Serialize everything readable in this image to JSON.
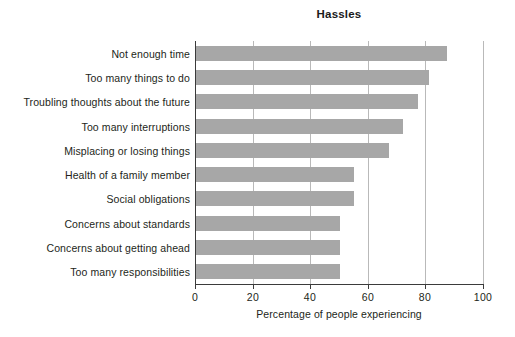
{
  "chart_data": {
    "type": "bar",
    "orientation": "horizontal",
    "title": "Hassles",
    "xlabel": "Percentage of people experiencing",
    "ylabel": "",
    "xlim": [
      0,
      100
    ],
    "xticks": [
      0,
      20,
      40,
      60,
      80,
      100
    ],
    "xtick_labels": [
      "0",
      "20",
      "40",
      "60",
      "80",
      "100"
    ],
    "grid": "vertical",
    "legend": "none",
    "bar_color": "#a7a7a7",
    "categories": [
      "Not enough time",
      "Too many things to do",
      "Troubling thoughts about the future",
      "Too many interruptions",
      "Misplacing or losing things",
      "Health of a family member",
      "Social obligations",
      "Concerns about standards",
      "Concerns about getting ahead",
      "Too many responsibilities"
    ],
    "values": [
      87,
      81,
      77,
      72,
      67,
      55,
      55,
      50,
      50,
      50
    ]
  }
}
